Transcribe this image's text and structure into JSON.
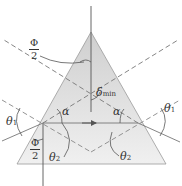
{
  "diagram": {
    "colors": {
      "prism_fill": "#dcdcdc",
      "prism_fill_light": "#eeeeee",
      "line": "#555555",
      "dashed": "#777777",
      "text": "#333333"
    },
    "labels": {
      "phi_top": {
        "numerator": "Φ",
        "denominator": "2"
      },
      "phi_bottom": {
        "numerator": "Φ",
        "denominator": "2"
      },
      "delta_min": {
        "symbol": "δ",
        "subscript": "min"
      },
      "alpha_left": "α",
      "alpha_right": "α",
      "theta1_left": {
        "symbol": "θ",
        "subscript": "1"
      },
      "theta1_right": {
        "symbol": "θ",
        "subscript": "1"
      },
      "theta2_left": {
        "symbol": "θ",
        "subscript": "2"
      },
      "theta2_right": {
        "symbol": "θ",
        "subscript": "2"
      }
    }
  }
}
